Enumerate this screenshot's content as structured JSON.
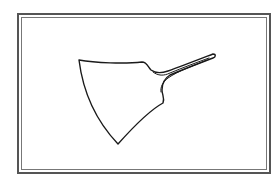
{
  "figure": {
    "frame": "double-line border",
    "colors": {
      "line": "#1a1a1a",
      "frame": "#555555",
      "background": "#ffffff"
    }
  }
}
